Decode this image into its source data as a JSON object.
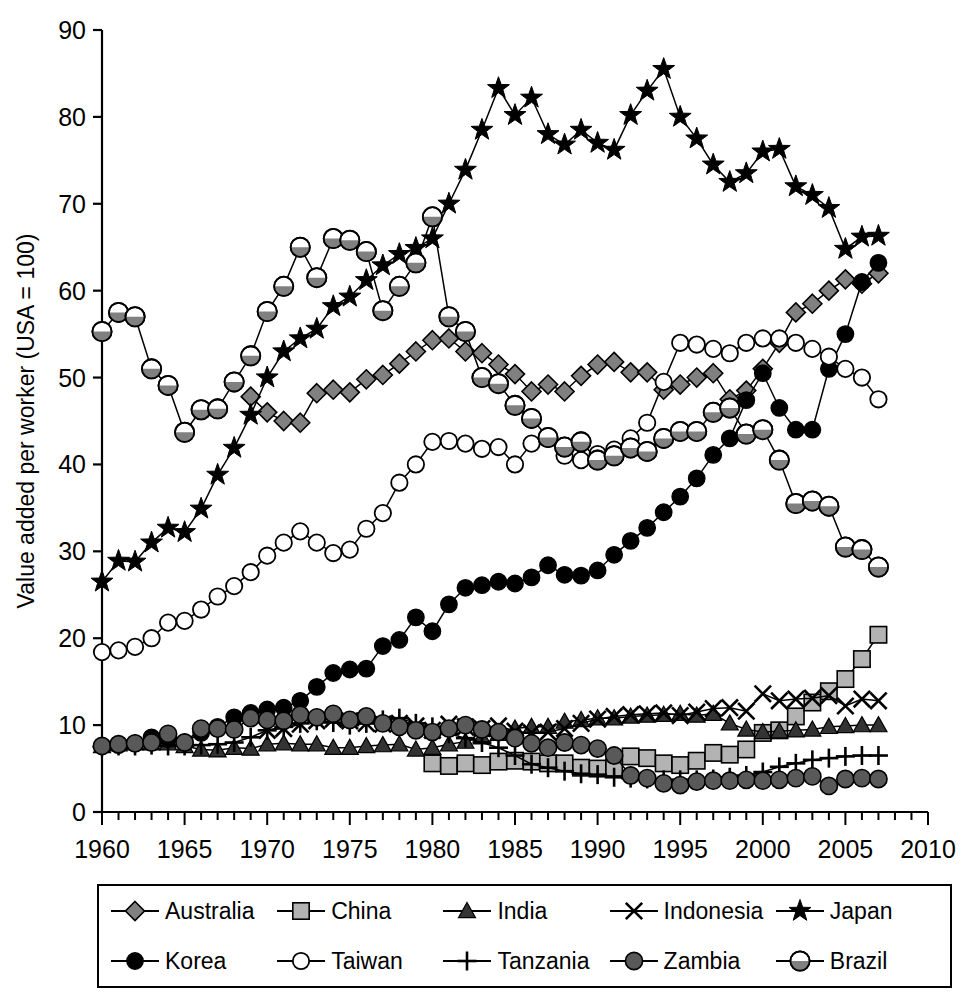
{
  "chart_data": {
    "type": "line",
    "title": "",
    "xlabel": "",
    "ylabel": "Value added per worker (USA = 100)",
    "xlim": [
      1960,
      2010
    ],
    "ylim": [
      0,
      90
    ],
    "xticks": [
      1960,
      1965,
      1970,
      1975,
      1980,
      1985,
      1990,
      1995,
      2000,
      2005,
      2010
    ],
    "yticks": [
      0,
      10,
      20,
      30,
      40,
      50,
      60,
      70,
      80,
      90
    ],
    "minor_xtick_interval": 1,
    "grid": false,
    "legend_position": "below-plot",
    "legend_columns": 5,
    "legend_rows": 2,
    "series": [
      {
        "name": "Australia",
        "marker": "diamond",
        "color": "#808080",
        "x": [
          1969,
          1970,
          1971,
          1972,
          1973,
          1974,
          1975,
          1976,
          1977,
          1978,
          1979,
          1980,
          1981,
          1982,
          1983,
          1984,
          1985,
          1986,
          1987,
          1988,
          1989,
          1990,
          1991,
          1992,
          1993,
          1994,
          1995,
          1996,
          1997,
          1998,
          1999,
          2000,
          2001,
          2002,
          2003,
          2004,
          2005,
          2006,
          2007
        ],
        "values": [
          47.8,
          46.0,
          45.0,
          44.8,
          48.2,
          48.6,
          48.3,
          49.8,
          50.3,
          51.6,
          53.0,
          54.3,
          54.5,
          53.0,
          52.8,
          51.5,
          50.4,
          48.4,
          49.2,
          48.4,
          50.2,
          51.5,
          51.8,
          50.6,
          50.6,
          48.6,
          49.2,
          50.0,
          50.5,
          47.5,
          48.5,
          51.0,
          54.0,
          57.5,
          58.5,
          60.0,
          61.3,
          60.8,
          62.0
        ]
      },
      {
        "name": "China",
        "marker": "square",
        "color": "#b3b3b3",
        "x": [
          1980,
          1981,
          1982,
          1983,
          1984,
          1985,
          1986,
          1987,
          1988,
          1989,
          1990,
          1991,
          1992,
          1993,
          1994,
          1995,
          1996,
          1997,
          1998,
          1999,
          2000,
          2001,
          2002,
          2003,
          2004,
          2005,
          2006,
          2007
        ],
        "values": [
          5.6,
          5.3,
          5.6,
          5.4,
          5.8,
          5.9,
          5.8,
          5.6,
          5.6,
          5.1,
          5.0,
          5.1,
          6.4,
          6.2,
          5.6,
          5.4,
          5.9,
          6.8,
          6.6,
          7.2,
          9.1,
          9.4,
          11.0,
          12.6,
          13.9,
          15.3,
          17.6,
          20.4
        ]
      },
      {
        "name": "India",
        "marker": "triangle",
        "color": "#333333",
        "x": [
          1960,
          1961,
          1962,
          1963,
          1964,
          1965,
          1966,
          1967,
          1968,
          1969,
          1970,
          1971,
          1972,
          1973,
          1974,
          1975,
          1976,
          1977,
          1978,
          1979,
          1980,
          1981,
          1982,
          1983,
          1984,
          1985,
          1986,
          1987,
          1988,
          1989,
          1990,
          1991,
          1992,
          1993,
          1994,
          1995,
          1996,
          1997,
          1998,
          1999,
          2000,
          2001,
          2002,
          2003,
          2004,
          2005,
          2006,
          2007
        ],
        "values": [
          7.6,
          7.8,
          7.9,
          7.9,
          7.9,
          7.6,
          7.2,
          7.1,
          7.4,
          7.3,
          7.8,
          7.9,
          7.8,
          7.8,
          7.4,
          7.4,
          7.6,
          7.7,
          7.8,
          7.2,
          7.4,
          7.8,
          8.1,
          8.6,
          9.0,
          9.6,
          9.8,
          9.8,
          10.4,
          10.6,
          10.8,
          10.8,
          11.0,
          11.1,
          11.2,
          11.3,
          11.1,
          11.3,
          10.2,
          9.5,
          9.2,
          9.3,
          9.4,
          9.5,
          9.8,
          9.9,
          10.0,
          10.0
        ]
      },
      {
        "name": "Indonesia",
        "marker": "cross-x",
        "color": "#000000",
        "x": [
          1970,
          1971,
          1972,
          1973,
          1974,
          1975,
          1976,
          1977,
          1978,
          1979,
          1980,
          1981,
          1982,
          1983,
          1984,
          1985,
          1986,
          1987,
          1988,
          1989,
          1990,
          1991,
          1992,
          1993,
          1994,
          1995,
          1996,
          1997,
          1998,
          1999,
          2000,
          2001,
          2002,
          2003,
          2004,
          2005,
          2006,
          2007
        ],
        "values": [
          9.4,
          9.6,
          10.1,
          10.5,
          10.7,
          10.5,
          10.2,
          10.1,
          10.2,
          9.9,
          9.4,
          10.1,
          9.8,
          9.6,
          9.9,
          9.3,
          9.1,
          9.2,
          9.6,
          10.2,
          10.7,
          11.0,
          11.2,
          11.3,
          11.4,
          11.1,
          11.5,
          11.9,
          12.0,
          11.6,
          13.6,
          12.8,
          13.0,
          13.1,
          13.4,
          12.2,
          13.0,
          12.8
        ]
      },
      {
        "name": "Japan",
        "marker": "star",
        "color": "#000000",
        "x": [
          1960,
          1961,
          1962,
          1963,
          1964,
          1965,
          1966,
          1967,
          1968,
          1969,
          1970,
          1971,
          1972,
          1973,
          1974,
          1975,
          1976,
          1977,
          1978,
          1979,
          1980,
          1981,
          1982,
          1983,
          1984,
          1985,
          1986,
          1987,
          1988,
          1989,
          1990,
          1991,
          1992,
          1993,
          1994,
          1995,
          1996,
          1997,
          1998,
          1999,
          2000,
          2001,
          2002,
          2003,
          2004,
          2005,
          2006,
          2007
        ],
        "values": [
          26.5,
          28.9,
          28.8,
          31.0,
          32.7,
          32.2,
          34.9,
          38.8,
          41.9,
          45.7,
          50.0,
          53.0,
          54.5,
          55.6,
          58.2,
          59.3,
          61.2,
          62.9,
          64.2,
          64.9,
          66.0,
          70.0,
          73.9,
          78.5,
          83.3,
          80.2,
          82.2,
          78.0,
          76.8,
          78.5,
          77.0,
          76.2,
          80.2,
          83.0,
          85.5,
          80.0,
          77.5,
          74.5,
          72.5,
          73.5,
          76.0,
          76.3,
          72.0,
          71.0,
          69.5,
          64.8,
          66.2,
          66.3
        ]
      },
      {
        "name": "Korea",
        "marker": "circle-filled",
        "color": "#000000",
        "x": [
          1960,
          1961,
          1962,
          1963,
          1964,
          1965,
          1966,
          1967,
          1968,
          1969,
          1970,
          1971,
          1972,
          1973,
          1974,
          1975,
          1976,
          1977,
          1978,
          1979,
          1980,
          1981,
          1982,
          1983,
          1984,
          1985,
          1986,
          1987,
          1988,
          1989,
          1990,
          1991,
          1992,
          1993,
          1994,
          1995,
          1996,
          1997,
          1998,
          1999,
          2000,
          2001,
          2002,
          2003,
          2004,
          2005,
          2006,
          2007
        ],
        "values": [
          7.6,
          7.7,
          7.9,
          8.6,
          8.4,
          8.0,
          9.1,
          9.8,
          10.9,
          11.4,
          11.8,
          12.0,
          12.8,
          14.4,
          16.0,
          16.4,
          16.5,
          19.1,
          19.8,
          22.4,
          20.8,
          23.9,
          25.8,
          26.1,
          26.5,
          26.3,
          27.0,
          28.4,
          27.3,
          27.2,
          27.8,
          29.6,
          31.2,
          32.7,
          34.5,
          36.3,
          38.4,
          41.1,
          43.0,
          47.4,
          50.5,
          46.5,
          44.0,
          44.0,
          51.0,
          55.0,
          61.0,
          63.2
        ]
      },
      {
        "name": "Taiwan",
        "marker": "circle-open",
        "color": "#ffffff",
        "x": [
          1960,
          1961,
          1962,
          1963,
          1964,
          1965,
          1966,
          1967,
          1968,
          1969,
          1970,
          1971,
          1972,
          1973,
          1974,
          1975,
          1976,
          1977,
          1978,
          1979,
          1980,
          1981,
          1982,
          1983,
          1984,
          1985,
          1986,
          1987,
          1988,
          1989,
          1990,
          1991,
          1992,
          1993,
          1994,
          1995,
          1996,
          1997,
          1998,
          1999,
          2000,
          2001,
          2002,
          2003,
          2004,
          2005,
          2006,
          2007
        ],
        "values": [
          18.4,
          18.6,
          19.0,
          20.0,
          21.8,
          22.0,
          23.3,
          24.8,
          26.0,
          27.6,
          29.5,
          31.0,
          32.3,
          31.0,
          29.8,
          30.2,
          32.6,
          34.4,
          37.9,
          40.0,
          42.6,
          42.7,
          42.4,
          41.8,
          42.0,
          40.0,
          42.4,
          43.0,
          41.0,
          40.5,
          41.2,
          41.7,
          43.0,
          44.8,
          49.5,
          54.0,
          53.8,
          53.3,
          52.8,
          54.0,
          54.5,
          54.5,
          54.0,
          53.3,
          52.4,
          51.0,
          50.0,
          47.5
        ]
      },
      {
        "name": "Tanzania",
        "marker": "plus",
        "color": "#000000",
        "x": [
          1960,
          1961,
          1962,
          1963,
          1964,
          1965,
          1966,
          1967,
          1968,
          1969,
          1970,
          1971,
          1972,
          1973,
          1974,
          1975,
          1976,
          1977,
          1978,
          1979,
          1980,
          1981,
          1982,
          1983,
          1984,
          1985,
          1986,
          1987,
          1988,
          1989,
          1990,
          1991,
          1992,
          1993,
          1994,
          1995,
          1996,
          1997,
          1998,
          1999,
          2000,
          2001,
          2002,
          2003,
          2004,
          2005,
          2006,
          2007
        ],
        "values": [
          7.5,
          7.6,
          7.6,
          7.7,
          7.6,
          7.6,
          7.7,
          7.8,
          8.0,
          8.6,
          9.4,
          9.8,
          10.2,
          10.5,
          10.3,
          10.0,
          10.2,
          10.6,
          10.8,
          10.2,
          9.8,
          9.0,
          8.5,
          8.0,
          7.4,
          6.5,
          5.5,
          5.1,
          4.7,
          4.4,
          4.3,
          4.0,
          3.9,
          3.8,
          3.7,
          3.7,
          3.7,
          3.8,
          4.0,
          4.2,
          4.6,
          5.2,
          5.6,
          6.0,
          6.2,
          6.4,
          6.5,
          6.5
        ]
      },
      {
        "name": "Zambia",
        "marker": "circle-dark",
        "color": "#595959",
        "x": [
          1960,
          1961,
          1962,
          1963,
          1964,
          1965,
          1966,
          1967,
          1968,
          1969,
          1970,
          1971,
          1972,
          1973,
          1974,
          1975,
          1976,
          1977,
          1978,
          1979,
          1980,
          1981,
          1982,
          1983,
          1984,
          1985,
          1986,
          1987,
          1988,
          1989,
          1990,
          1991,
          1992,
          1993,
          1994,
          1995,
          1996,
          1997,
          1998,
          1999,
          2000,
          2001,
          2002,
          2003,
          2004,
          2005,
          2006,
          2007
        ],
        "values": [
          7.6,
          7.8,
          7.9,
          8.0,
          9.0,
          8.0,
          9.6,
          9.6,
          9.5,
          10.8,
          10.6,
          10.5,
          11.2,
          10.9,
          11.3,
          10.6,
          11.0,
          10.2,
          9.8,
          9.4,
          9.2,
          9.6,
          10.0,
          9.5,
          9.2,
          8.5,
          7.9,
          7.4,
          8.0,
          7.7,
          7.3,
          6.5,
          4.2,
          3.9,
          3.3,
          3.1,
          3.5,
          3.6,
          3.6,
          3.7,
          3.6,
          3.7,
          3.9,
          4.1,
          3.0,
          3.8,
          3.9,
          3.8
        ]
      },
      {
        "name": "Brazil",
        "marker": "circle-half",
        "color": "#808080",
        "x": [
          1960,
          1961,
          1962,
          1963,
          1964,
          1965,
          1966,
          1967,
          1968,
          1969,
          1970,
          1971,
          1972,
          1973,
          1974,
          1975,
          1976,
          1977,
          1978,
          1979,
          1980,
          1981,
          1982,
          1983,
          1984,
          1985,
          1986,
          1987,
          1988,
          1989,
          1990,
          1991,
          1992,
          1993,
          1994,
          1995,
          1996,
          1997,
          1998,
          1999,
          2000,
          2001,
          2002,
          2003,
          2004,
          2005,
          2006,
          2007
        ],
        "values": [
          55.3,
          57.5,
          57.0,
          51.0,
          49.1,
          43.7,
          46.3,
          46.4,
          49.5,
          52.5,
          57.6,
          60.5,
          65.0,
          61.5,
          66.0,
          65.8,
          64.5,
          57.7,
          60.5,
          63.2,
          68.5,
          57.0,
          55.3,
          50.0,
          49.3,
          46.8,
          45.3,
          43.1,
          42.0,
          42.6,
          40.5,
          41.0,
          41.9,
          41.5,
          43.0,
          43.8,
          43.8,
          46.0,
          46.5,
          43.5,
          44.0,
          40.5,
          35.5,
          35.8,
          35.2,
          30.5,
          30.2,
          28.2
        ]
      }
    ]
  },
  "legend": {
    "rows": [
      [
        {
          "label": "Australia",
          "marker": "diamond"
        },
        {
          "label": "China",
          "marker": "square"
        },
        {
          "label": "India",
          "marker": "triangle"
        },
        {
          "label": "Indonesia",
          "marker": "cross-x"
        },
        {
          "label": "Japan",
          "marker": "star"
        }
      ],
      [
        {
          "label": "Korea",
          "marker": "circle-filled"
        },
        {
          "label": "Taiwan",
          "marker": "circle-open"
        },
        {
          "label": "Tanzania",
          "marker": "plus"
        },
        {
          "label": "Zambia",
          "marker": "circle-dark"
        },
        {
          "label": "Brazil",
          "marker": "circle-half"
        }
      ]
    ]
  },
  "colors": {
    "axis": "#000000",
    "plot_background": "#ffffff",
    "australia": "#808080",
    "china": "#b3b3b3",
    "india": "#333333",
    "indonesia": "#000000",
    "japan": "#000000",
    "korea": "#000000",
    "taiwan": "#ffffff",
    "tanzania": "#000000",
    "zambia": "#595959",
    "brazil": "#808080"
  }
}
